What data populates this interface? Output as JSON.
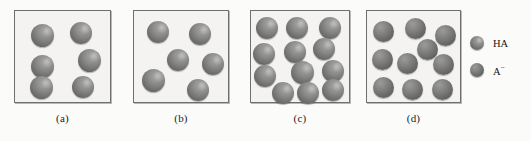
{
  "figure": {
    "background_color": "#fbfbfa",
    "box_fill_color": "#f4f3f1",
    "box_border_color": "#6f6f6f",
    "sphere_ha_color": "#7b7b7b",
    "sphere_a_color": "#646463"
  },
  "panels": [
    {
      "id": "a",
      "caption": "(a)",
      "box": {
        "x": 14,
        "y": 10,
        "w": 97,
        "h": 93
      },
      "caption_y": 112,
      "sphere_count": 6,
      "ha_count": 6,
      "a_count": 0,
      "spheres": [
        {
          "type": "ha",
          "x": 16,
          "y": 13,
          "d": 23
        },
        {
          "type": "ha",
          "x": 55,
          "y": 11,
          "d": 22
        },
        {
          "type": "ha",
          "x": 63,
          "y": 38,
          "d": 23
        },
        {
          "type": "ha",
          "x": 16,
          "y": 44,
          "d": 23
        },
        {
          "type": "ha",
          "x": 15,
          "y": 65,
          "d": 23
        },
        {
          "type": "ha",
          "x": 57,
          "y": 65,
          "d": 22
        }
      ]
    },
    {
      "id": "b",
      "caption": "(b)",
      "box": {
        "x": 133,
        "y": 10,
        "w": 96,
        "h": 93
      },
      "caption_y": 112,
      "sphere_count": 6,
      "ha_count": 6,
      "a_count": 0,
      "spheres": [
        {
          "type": "ha",
          "x": 13,
          "y": 10,
          "d": 22
        },
        {
          "type": "ha",
          "x": 55,
          "y": 12,
          "d": 22
        },
        {
          "type": "ha",
          "x": 33,
          "y": 38,
          "d": 22
        },
        {
          "type": "ha",
          "x": 68,
          "y": 42,
          "d": 22
        },
        {
          "type": "ha",
          "x": 8,
          "y": 58,
          "d": 23
        },
        {
          "type": "ha",
          "x": 53,
          "y": 68,
          "d": 22
        }
      ]
    },
    {
      "id": "c",
      "caption": "(c)",
      "box": {
        "x": 250,
        "y": 10,
        "w": 100,
        "h": 93
      },
      "caption_y": 112,
      "sphere_count": 12,
      "ha_count": 12,
      "a_count": 0,
      "spheres": [
        {
          "type": "ha",
          "x": 5,
          "y": 6,
          "d": 22
        },
        {
          "type": "ha",
          "x": 35,
          "y": 6,
          "d": 22
        },
        {
          "type": "ha",
          "x": 68,
          "y": 6,
          "d": 22
        },
        {
          "type": "ha",
          "x": 2,
          "y": 32,
          "d": 22
        },
        {
          "type": "ha",
          "x": 33,
          "y": 30,
          "d": 22
        },
        {
          "type": "ha",
          "x": 62,
          "y": 27,
          "d": 22
        },
        {
          "type": "ha",
          "x": 3,
          "y": 54,
          "d": 22
        },
        {
          "type": "ha",
          "x": 40,
          "y": 50,
          "d": 23
        },
        {
          "type": "ha",
          "x": 71,
          "y": 49,
          "d": 22
        },
        {
          "type": "ha",
          "x": 21,
          "y": 71,
          "d": 22
        },
        {
          "type": "ha",
          "x": 46,
          "y": 71,
          "d": 22
        },
        {
          "type": "ha",
          "x": 71,
          "y": 68,
          "d": 22
        }
      ]
    },
    {
      "id": "d",
      "caption": "(d)",
      "box": {
        "x": 366,
        "y": 10,
        "w": 95,
        "h": 93
      },
      "caption_y": 112,
      "sphere_count": 10,
      "ha_count": 0,
      "a_count": 10,
      "spheres": [
        {
          "type": "am",
          "x": 6,
          "y": 10,
          "d": 21
        },
        {
          "type": "am",
          "x": 38,
          "y": 7,
          "d": 21
        },
        {
          "type": "am",
          "x": 68,
          "y": 14,
          "d": 21
        },
        {
          "type": "am",
          "x": 50,
          "y": 28,
          "d": 21
        },
        {
          "type": "am",
          "x": 5,
          "y": 38,
          "d": 21
        },
        {
          "type": "am",
          "x": 30,
          "y": 42,
          "d": 21
        },
        {
          "type": "am",
          "x": 66,
          "y": 43,
          "d": 21
        },
        {
          "type": "am",
          "x": 6,
          "y": 66,
          "d": 21
        },
        {
          "type": "am",
          "x": 35,
          "y": 68,
          "d": 21
        },
        {
          "type": "am",
          "x": 65,
          "y": 68,
          "d": 21
        }
      ]
    }
  ],
  "legend": {
    "x": 470,
    "y": 36,
    "items": [
      {
        "key": "ha",
        "type": "ha",
        "label": "HA",
        "superscript": "",
        "y": 0
      },
      {
        "key": "a-minus",
        "type": "am",
        "label": "A",
        "superscript": "−",
        "y": 27
      }
    ]
  }
}
